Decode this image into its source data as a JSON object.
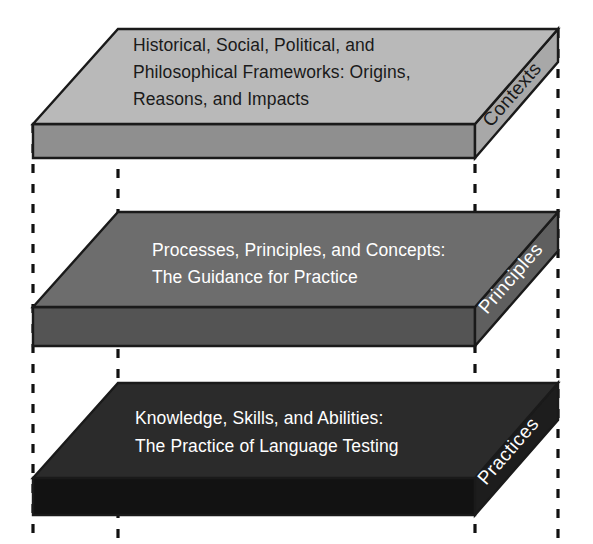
{
  "diagram": {
    "type": "layered-3d-slabs",
    "canvas": {
      "width": 593,
      "height": 544,
      "background": "#ffffff"
    },
    "colors": {
      "outline": "#1a1a1a",
      "guide_line": "#111111",
      "top_layer_face": "#b9b9b9",
      "top_layer_front": "#8f8f8f",
      "top_layer_text": "#1a1a1a",
      "middle_layer_face": "#6d6d6d",
      "middle_layer_front": "#545454",
      "middle_layer_text": "#ffffff",
      "bottom_layer_face": "#2b2b2b",
      "bottom_layer_front": "#121212",
      "bottom_layer_text": "#ffffff"
    },
    "layers": [
      {
        "id": "contexts",
        "side_label": "Contexts",
        "lines": [
          "Historical, Social, Political, and",
          "Philosophical Frameworks: Origins,",
          "Reasons, and Impacts"
        ],
        "face_color": "#b9b9b9",
        "front_color": "#8f8f8f",
        "text_color": "#1a1a1a",
        "side_label_color": "#1a1a1a"
      },
      {
        "id": "principles",
        "side_label": "Principles",
        "lines": [
          "Processes, Principles, and Concepts:",
          "The Guidance for Practice"
        ],
        "face_color": "#6d6d6d",
        "front_color": "#545454",
        "text_color": "#ffffff",
        "side_label_color": "#ffffff"
      },
      {
        "id": "practices",
        "side_label": "Practices",
        "lines": [
          "Knowledge, Skills, and Abilities:",
          "The Practice of Language Testing"
        ],
        "face_color": "#2b2b2b",
        "front_color": "#121212",
        "text_color": "#ffffff",
        "side_label_color": "#ffffff"
      }
    ],
    "guides": {
      "count": 4,
      "x_positions": [
        33,
        118,
        475,
        558
      ],
      "style": "dashed-vertical"
    }
  }
}
